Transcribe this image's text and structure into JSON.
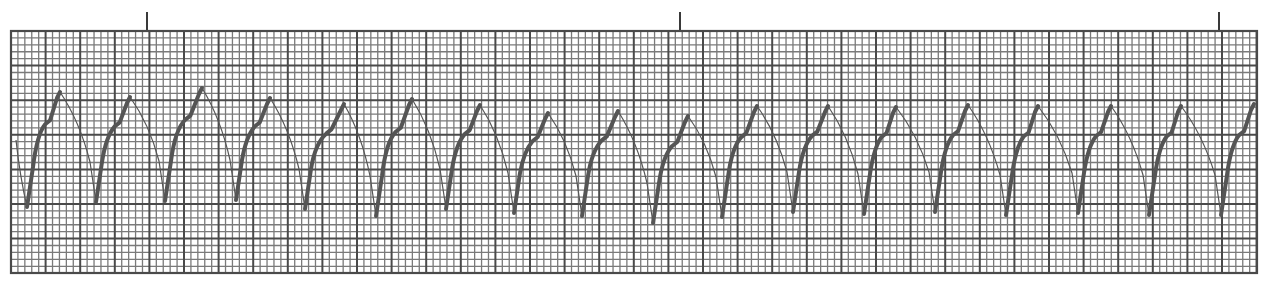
{
  "chart_data": {
    "type": "line",
    "title": "",
    "subtitle": "",
    "xlabel": "",
    "ylabel": "",
    "grid": {
      "on": true,
      "x0": 11,
      "y0": 31,
      "x1": 1257,
      "y1": 273,
      "large_box_px_x": 34.6,
      "large_box_px_y": 34.6,
      "small_per_large": 5,
      "minor_color": "#7a7a7a",
      "major_color": "#4a4a4a",
      "background": "#ffffff"
    },
    "markers": {
      "x": [
        147,
        680,
        1219
      ],
      "top": 12,
      "bottom": 31,
      "color": "#3a3a3a"
    },
    "trace": {
      "color": "#555555",
      "thick_width": 4,
      "thin_width": 1.2,
      "troughs": [
        {
          "x": 27,
          "y": 207
        },
        {
          "x": 96,
          "y": 202
        },
        {
          "x": 165,
          "y": 201
        },
        {
          "x": 236,
          "y": 200
        },
        {
          "x": 305,
          "y": 209
        },
        {
          "x": 376,
          "y": 216
        },
        {
          "x": 446,
          "y": 209
        },
        {
          "x": 514,
          "y": 213
        },
        {
          "x": 582,
          "y": 216
        },
        {
          "x": 653,
          "y": 223
        },
        {
          "x": 722,
          "y": 217
        },
        {
          "x": 793,
          "y": 212
        },
        {
          "x": 864,
          "y": 214
        },
        {
          "x": 935,
          "y": 212
        },
        {
          "x": 1006,
          "y": 215
        },
        {
          "x": 1078,
          "y": 213
        },
        {
          "x": 1149,
          "y": 215
        },
        {
          "x": 1221,
          "y": 215
        }
      ],
      "peaks": [
        {
          "x": 60,
          "y": 92
        },
        {
          "x": 130,
          "y": 97
        },
        {
          "x": 202,
          "y": 88
        },
        {
          "x": 270,
          "y": 98
        },
        {
          "x": 344,
          "y": 104
        },
        {
          "x": 412,
          "y": 99
        },
        {
          "x": 480,
          "y": 105
        },
        {
          "x": 548,
          "y": 113
        },
        {
          "x": 618,
          "y": 111
        },
        {
          "x": 688,
          "y": 116
        },
        {
          "x": 757,
          "y": 106
        },
        {
          "x": 828,
          "y": 106
        },
        {
          "x": 896,
          "y": 107
        },
        {
          "x": 968,
          "y": 105
        },
        {
          "x": 1038,
          "y": 106
        },
        {
          "x": 1111,
          "y": 106
        },
        {
          "x": 1181,
          "y": 106
        },
        {
          "x": 1254,
          "y": 104
        }
      ],
      "start": {
        "x": 16,
        "y": 140
      },
      "end": {
        "x": 1256,
        "y": 104
      }
    },
    "beat_count": 18,
    "rhythm_label": ""
  }
}
